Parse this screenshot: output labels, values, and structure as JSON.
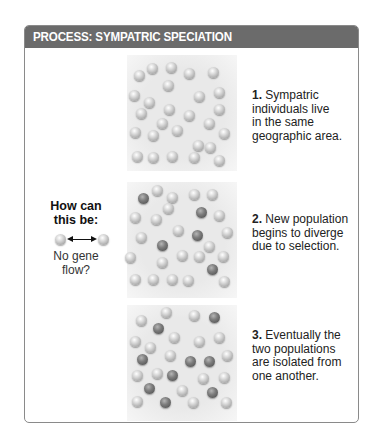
{
  "header": {
    "title": "PROCESS: SYMPATRIC SPECIATION"
  },
  "colors": {
    "header_bg": "#6b6b6b",
    "frame_border": "#8a8a8a",
    "panel_bg": "#e9e9e9",
    "light_dot": "#d0d0d0",
    "dark_dot": "#6a6a6a"
  },
  "question": {
    "title_line1": "How can",
    "title_line2": "this be:",
    "sub_line1": "No gene",
    "sub_line2": "flow?",
    "icon": "double-arrow-between-individuals"
  },
  "steps": [
    {
      "number": "1.",
      "lines": [
        "Sympatric",
        "individuals live",
        "in the same",
        "geographic area."
      ]
    },
    {
      "number": "2.",
      "lines": [
        "New population",
        "begins to diverge",
        "due to selection."
      ]
    },
    {
      "number": "3.",
      "lines": [
        "Eventually the",
        "two populations",
        "are isolated from",
        "one another."
      ]
    }
  ],
  "panels": [
    {
      "name": "panel-1",
      "top": 55,
      "dots": [
        [
          139,
          75,
          0
        ],
        [
          152,
          68,
          0
        ],
        [
          171,
          67,
          0
        ],
        [
          189,
          73,
          0
        ],
        [
          213,
          72,
          0
        ],
        [
          168,
          85,
          0
        ],
        [
          134,
          95,
          0
        ],
        [
          149,
          102,
          0
        ],
        [
          199,
          96,
          0
        ],
        [
          219,
          92,
          0
        ],
        [
          141,
          113,
          0
        ],
        [
          169,
          109,
          0
        ],
        [
          189,
          115,
          0
        ],
        [
          219,
          109,
          0
        ],
        [
          162,
          123,
          0
        ],
        [
          209,
          123,
          0
        ],
        [
          135,
          132,
          0
        ],
        [
          153,
          135,
          0
        ],
        [
          177,
          130,
          0
        ],
        [
          224,
          133,
          0
        ],
        [
          198,
          145,
          0
        ],
        [
          210,
          147,
          0
        ],
        [
          137,
          156,
          0
        ],
        [
          153,
          157,
          0
        ],
        [
          172,
          156,
          0
        ],
        [
          194,
          157,
          0
        ],
        [
          219,
          160,
          0
        ]
      ]
    },
    {
      "name": "panel-2",
      "top": 182,
      "dots": [
        [
          143,
          198,
          1
        ],
        [
          157,
          190,
          0
        ],
        [
          172,
          197,
          0
        ],
        [
          194,
          194,
          0
        ],
        [
          212,
          194,
          0
        ],
        [
          168,
          208,
          0
        ],
        [
          135,
          217,
          0
        ],
        [
          156,
          219,
          0
        ],
        [
          201,
          212,
          1
        ],
        [
          219,
          215,
          0
        ],
        [
          141,
          237,
          0
        ],
        [
          178,
          230,
          0
        ],
        [
          197,
          235,
          1
        ],
        [
          227,
          232,
          0
        ],
        [
          162,
          245,
          1
        ],
        [
          209,
          246,
          0
        ],
        [
          130,
          257,
          0
        ],
        [
          162,
          262,
          0
        ],
        [
          182,
          255,
          0
        ],
        [
          199,
          256,
          0
        ],
        [
          223,
          256,
          0
        ],
        [
          212,
          269,
          1
        ],
        [
          135,
          279,
          0
        ],
        [
          153,
          279,
          0
        ],
        [
          172,
          279,
          0
        ],
        [
          188,
          280,
          0
        ],
        [
          224,
          281,
          0
        ]
      ]
    },
    {
      "name": "panel-3",
      "top": 305,
      "dots": [
        [
          141,
          320,
          0
        ],
        [
          166,
          312,
          0
        ],
        [
          194,
          315,
          0
        ],
        [
          214,
          317,
          1
        ],
        [
          158,
          328,
          1
        ],
        [
          135,
          341,
          0
        ],
        [
          150,
          347,
          0
        ],
        [
          174,
          337,
          0
        ],
        [
          199,
          341,
          0
        ],
        [
          219,
          337,
          0
        ],
        [
          142,
          359,
          1
        ],
        [
          170,
          355,
          0
        ],
        [
          190,
          361,
          1
        ],
        [
          209,
          361,
          1
        ],
        [
          227,
          355,
          0
        ],
        [
          137,
          375,
          0
        ],
        [
          157,
          373,
          0
        ],
        [
          172,
          375,
          1
        ],
        [
          203,
          378,
          0
        ],
        [
          224,
          377,
          0
        ],
        [
          149,
          388,
          1
        ],
        [
          182,
          390,
          0
        ],
        [
          212,
          392,
          1
        ],
        [
          137,
          401,
          0
        ],
        [
          165,
          402,
          1
        ],
        [
          193,
          402,
          0
        ],
        [
          226,
          402,
          0
        ]
      ]
    }
  ]
}
